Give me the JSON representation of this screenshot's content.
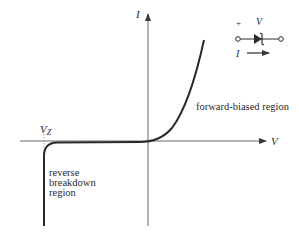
{
  "diagram": {
    "axes": {
      "x_label": "V",
      "y_label": "I"
    },
    "annotations": {
      "vz_label": "V",
      "vz_subscript": "Z",
      "forward_region": "forward-biased region",
      "reverse_region_line1": "reverse",
      "reverse_region_line2": "breakdown",
      "reverse_region_line3": "region"
    },
    "symbol": {
      "plus_sign": "+",
      "voltage_label": "V",
      "current_label": "I",
      "component": "zener-diode"
    },
    "colors": {
      "curve": "#2a2a2a",
      "axis": "#6a6a6a",
      "text": "#2a2a2a"
    }
  }
}
